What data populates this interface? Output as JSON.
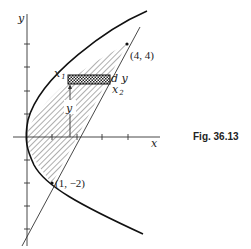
{
  "figure": {
    "caption": "Fig. 36.13",
    "axes": {
      "x_label": "x",
      "y_label": "y"
    },
    "points": [
      {
        "label": "(4, 4)",
        "x": 4,
        "y": 4
      },
      {
        "label": "(1, −2)",
        "x": 1,
        "y": -2
      }
    ],
    "strip_labels": {
      "x1": "x",
      "x1_sub": "1",
      "x2": "x",
      "x2_sub": "2",
      "dy": "d y",
      "y": "y"
    },
    "curves": [
      {
        "name": "parabola",
        "equation": "y^2 = 4x"
      },
      {
        "name": "line",
        "equation": "y = 2x - 4"
      }
    ]
  }
}
